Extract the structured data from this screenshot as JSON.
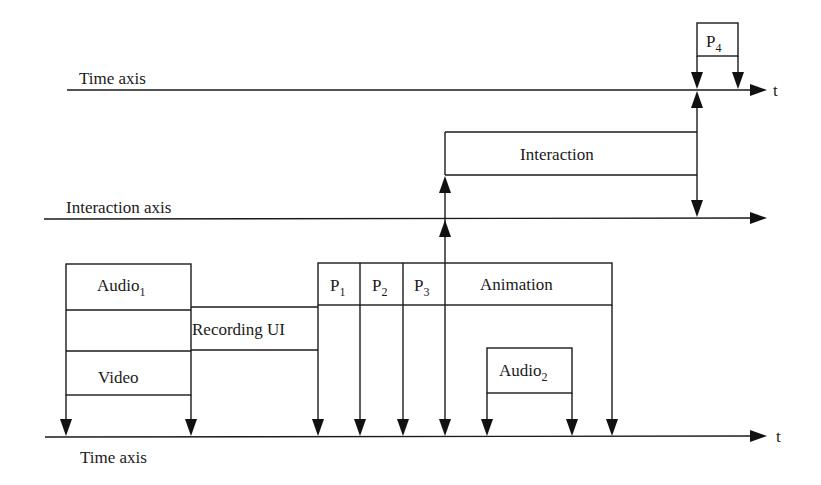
{
  "diagram": {
    "axes": {
      "top_time_axis": {
        "label": "Time axis",
        "end_label": "t"
      },
      "interaction_axis": {
        "label": "Interaction axis"
      },
      "bottom_time_axis": {
        "label": "Time axis",
        "end_label": "t"
      }
    },
    "boxes": {
      "audio1": {
        "label": "Audio",
        "subscript": "1"
      },
      "video": {
        "label": "Video"
      },
      "recording_ui": {
        "label": "Recording UI"
      },
      "p1": {
        "label": "P",
        "subscript": "1"
      },
      "p2": {
        "label": "P",
        "subscript": "2"
      },
      "p3": {
        "label": "P",
        "subscript": "3"
      },
      "animation": {
        "label": "Animation"
      },
      "audio2": {
        "label": "Audio",
        "subscript": "2"
      },
      "interaction": {
        "label": "Interaction"
      },
      "p4": {
        "label": "P",
        "subscript": "4"
      }
    },
    "colors": {
      "ink": "#1a1a1a",
      "background": "#ffffff"
    }
  }
}
